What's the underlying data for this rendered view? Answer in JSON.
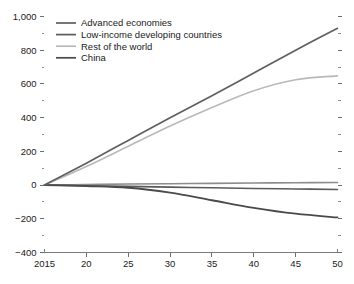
{
  "chart_data": {
    "type": "line",
    "title": "",
    "subtitle": "",
    "xlabel": "",
    "ylabel": "",
    "xlim": [
      2015,
      2050
    ],
    "ylim": [
      -400,
      1000
    ],
    "grid": false,
    "legend_position": "top-left",
    "x_tick_labels": [
      "2015",
      "20",
      "25",
      "30",
      "35",
      "40",
      "45",
      "50"
    ],
    "x_tick_values": [
      2015,
      2020,
      2025,
      2030,
      2035,
      2040,
      2045,
      2050
    ],
    "y_tick_labels": [
      "1,000",
      "800",
      "600",
      "400",
      "200",
      "0",
      "−200",
      "−400"
    ],
    "y_tick_values": [
      1000,
      800,
      600,
      400,
      200,
      0,
      -200,
      -400
    ],
    "y_minor_tick_values": [
      900,
      700,
      500,
      300,
      100,
      -100,
      -300
    ],
    "x": [
      2015,
      2020,
      2025,
      2030,
      2035,
      2040,
      2045,
      2050
    ],
    "series": [
      {
        "name": "Advanced economies",
        "color": "#8c8c8c",
        "width": 1.6,
        "values": [
          0,
          3,
          6,
          8,
          10,
          12,
          14,
          15
        ]
      },
      {
        "name": "Low-income developing countries",
        "color": "#5a5a5a",
        "width": 1.6,
        "values": [
          0,
          -4,
          -8,
          -12,
          -16,
          -20,
          -23,
          -26
        ]
      },
      {
        "name": "Rest of the world",
        "color": "#b9b9b9",
        "width": 1.6,
        "values": [
          0,
          110,
          230,
          350,
          460,
          560,
          625,
          648
        ]
      },
      {
        "name": "China",
        "color": "#4a4a4a",
        "width": 1.8,
        "values": [
          0,
          -6,
          -16,
          -45,
          -90,
          -135,
          -170,
          -192
        ]
      },
      {
        "name": "Advanced economies rising",
        "color": "#5f5f5f",
        "width": 1.7,
        "values": [
          0,
          130,
          265,
          400,
          530,
          665,
          800,
          930
        ]
      }
    ],
    "legend_entries": [
      {
        "label": "Advanced economies",
        "color": "#5f5f5f"
      },
      {
        "label": "Low-income developing countries",
        "color": "#5a5a5a"
      },
      {
        "label": "Rest of the world",
        "color": "#b9b9b9"
      },
      {
        "label": "China",
        "color": "#4a4a4a"
      }
    ],
    "annotations": []
  }
}
